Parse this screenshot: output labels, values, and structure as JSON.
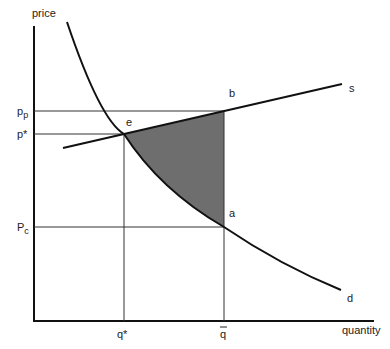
{
  "diagram": {
    "type": "supply-demand",
    "axes": {
      "y_label": "price",
      "x_label": "quantity"
    },
    "price_labels": {
      "pp_main": "p",
      "pp_sub": "p",
      "pstar": "p*",
      "pc_main": "P",
      "pc_sub": "c"
    },
    "quantity_labels": {
      "qstar": "q*",
      "qbar": "q"
    },
    "point_labels": {
      "e": "e",
      "b": "b",
      "a": "a"
    },
    "curve_labels": {
      "supply": "s",
      "demand": "d"
    },
    "colors": {
      "line": "#111111",
      "guide": "#333333",
      "shade": "#6e6e6e"
    }
  }
}
